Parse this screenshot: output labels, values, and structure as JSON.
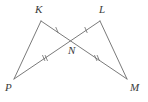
{
  "figure": {
    "type": "geometry-diagram",
    "width": 148,
    "height": 102,
    "background_color": "#ffffff",
    "stroke_color": "#6b6b6b",
    "label_color": "#3a3a3a"
  },
  "points": [
    {
      "name": "K",
      "label": "K",
      "x": 41,
      "y": 21,
      "label_x": 35,
      "label_y": 4
    },
    {
      "name": "L",
      "label": "L",
      "x": 100,
      "y": 21,
      "label_x": 99,
      "label_y": 4
    },
    {
      "name": "N",
      "label": "N",
      "x": 72,
      "y": 39,
      "label_x": 68,
      "label_y": 45
    },
    {
      "name": "P",
      "label": "P",
      "x": 14,
      "y": 79,
      "label_x": 5,
      "label_y": 82
    },
    {
      "name": "M",
      "label": "M",
      "x": 127,
      "y": 79,
      "label_x": 130,
      "label_y": 82
    }
  ],
  "segments": [
    {
      "name": "segment-P-K",
      "from": "P",
      "to": "K",
      "ticks": 0
    },
    {
      "name": "segment-L-M",
      "from": "L",
      "to": "M",
      "ticks": 0
    },
    {
      "name": "segment-P-L",
      "from": "P",
      "to": "L",
      "ticks": 0
    },
    {
      "name": "segment-K-M",
      "from": "K",
      "to": "M",
      "ticks": 0
    }
  ],
  "tick_marks": [
    {
      "name": "tick-P-N",
      "on_segment": "segment-P-L",
      "count": 2,
      "x": 45,
      "y": 58
    },
    {
      "name": "tick-N-M",
      "on_segment": "segment-K-M",
      "count": 2,
      "x": 97,
      "y": 58
    },
    {
      "name": "tick-K-N",
      "on_segment": "segment-K-M",
      "count": 1,
      "x": 57,
      "y": 30
    },
    {
      "name": "tick-N-L",
      "on_segment": "segment-P-L",
      "count": 1,
      "x": 86,
      "y": 30
    }
  ]
}
